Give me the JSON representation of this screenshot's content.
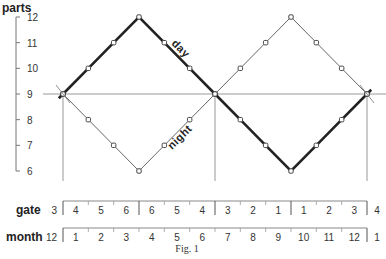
{
  "chart_data": {
    "type": "line",
    "title": "",
    "caption": "Fig. 1",
    "ylabel": "parts",
    "ylim": [
      6,
      12
    ],
    "yticks": [
      6,
      7,
      8,
      9,
      10,
      11,
      12
    ],
    "grid": false,
    "x_steps": [
      0,
      1,
      2,
      3,
      4,
      5,
      6,
      7,
      8,
      9,
      10,
      11,
      12
    ],
    "series": [
      {
        "name": "day",
        "style": "thick",
        "values": [
          9,
          10,
          11,
          12,
          11,
          10,
          9,
          8,
          7,
          6,
          7,
          8,
          9
        ]
      },
      {
        "name": "night",
        "style": "thin",
        "values": [
          9,
          8,
          7,
          6,
          7,
          8,
          9,
          10,
          11,
          12,
          11,
          10,
          9
        ]
      }
    ],
    "reference_line": {
      "y": 9
    },
    "equinox_markers_x_steps": [
      0,
      6,
      12
    ],
    "scales": [
      {
        "name": "gate",
        "start_label": "3",
        "segments": [
          "4",
          "5",
          "6",
          "6",
          "5",
          "4",
          "3",
          "2",
          "1",
          "1",
          "2",
          "3"
        ],
        "end_label": "4",
        "major_divisions_after": [
          0,
          3,
          6,
          9,
          12
        ]
      },
      {
        "name": "month",
        "start_label": "12",
        "segments": [
          "1",
          "2",
          "3",
          "4",
          "5",
          "6",
          "7",
          "8",
          "9",
          "10",
          "11",
          "12"
        ],
        "end_label": "1",
        "major_divisions_after": [
          0,
          12
        ]
      }
    ]
  },
  "labels": {
    "ylabel": "parts",
    "day": "day",
    "night": "night",
    "gate": "gate",
    "month": "month",
    "caption": "Fig. 1"
  }
}
